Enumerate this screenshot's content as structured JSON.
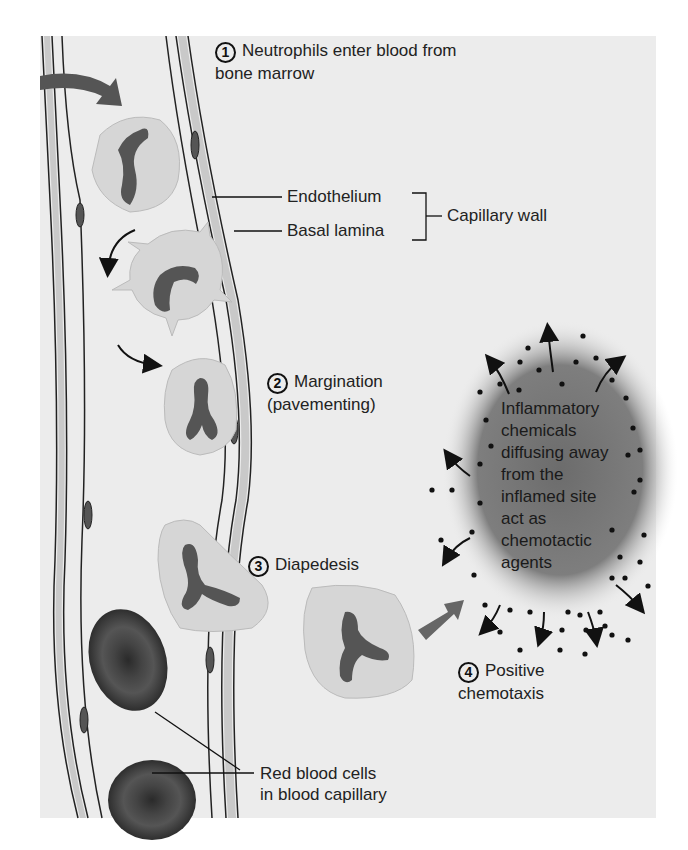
{
  "figure": {
    "steps": [
      {
        "number": "1",
        "label_line1": "Neutrophils enter blood from",
        "label_line2": "bone marrow"
      },
      {
        "number": "2",
        "label_line1": "Margination",
        "label_line2": "(pavementing)"
      },
      {
        "number": "3",
        "label_line1": "Diapedesis"
      },
      {
        "number": "4",
        "label_line1": "Positive",
        "label_line2": "chemotaxis"
      }
    ],
    "wall_labels": {
      "endothelium": "Endothelium",
      "basal_lamina": "Basal lamina",
      "capillary_wall": "Capillary wall"
    },
    "rbc_label": {
      "line1": "Red blood cells",
      "line2": "in blood capillary"
    },
    "inflamed_site": {
      "lines": [
        "Inflammatory",
        "chemicals",
        "diffusing away",
        "from the",
        "inflamed site",
        "act as",
        "chemotactic",
        "agents"
      ]
    },
    "colors": {
      "panel_bg": "#ececec",
      "vessel_wall": "#c9c9c9",
      "cell_cytoplasm": "#d6d6d6",
      "nucleus": "#555555",
      "rbc": "#3a3a3a",
      "arrow_gray": "#555555",
      "blob": "#7a7a7a"
    }
  }
}
